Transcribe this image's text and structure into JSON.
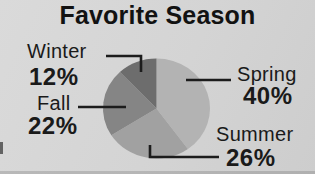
{
  "title": "Favorite Season",
  "palette": {
    "background": "#d4d4d4",
    "text": "#1a1a1a",
    "leader_line": "#1c1c1c",
    "slice_spring": "#b3b3b3",
    "slice_summer": "#a1a1a1",
    "slice_fall": "#858585",
    "slice_winter": "#6d6d6d"
  },
  "chart_data": {
    "type": "pie",
    "title": "Favorite Season",
    "categories": [
      "Spring",
      "Summer",
      "Fall",
      "Winter"
    ],
    "values": [
      40,
      26,
      22,
      12
    ],
    "slices": [
      {
        "name": "Spring",
        "value": 40,
        "color": "#b3b3b3"
      },
      {
        "name": "Summer",
        "value": 26,
        "color": "#a1a1a1"
      },
      {
        "name": "Fall",
        "value": 22,
        "color": "#858585"
      },
      {
        "name": "Winter",
        "value": 12,
        "color": "#6d6d6d"
      }
    ],
    "start_angle_deg": 0,
    "direction": "clockwise",
    "legend": "none",
    "label_style": "external callout labels with elbow leader lines, season name above bold percentage"
  },
  "labels": {
    "winter": {
      "name": "Winter",
      "percent": "12%"
    },
    "spring": {
      "name": "Spring",
      "percent": "40%"
    },
    "summer": {
      "name": "Summer",
      "percent": "26%"
    },
    "fall": {
      "name": "Fall",
      "percent": "22%"
    }
  }
}
